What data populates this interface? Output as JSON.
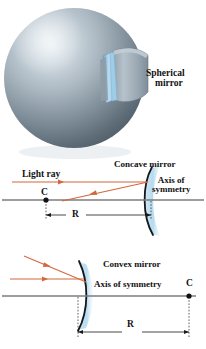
{
  "figure": {
    "title_labels": {
      "spherical_mirror_line1": "Spherical",
      "spherical_mirror_line2": "mirror",
      "concave_mirror": "Concave mirror",
      "axis_of_symmetry_line1": "Axis of",
      "axis_of_symmetry_line2": "symmetry",
      "light_ray": "Light ray",
      "center_point_concave": "C",
      "radius_concave": "R",
      "convex_mirror": "Convex mirror",
      "axis_of_symmetry_convex": "Axis of symmetry",
      "center_point_convex": "C",
      "radius_convex": "R"
    },
    "colors": {
      "ray": "#d4673c",
      "axis": "#7d7d7d",
      "mirror_glass": "#a9d4ec",
      "mirror_edge": "#1a1a1a",
      "sphere_light": "#cfd8de",
      "sphere_mid": "#98a6b0",
      "sphere_dark": "#5d6a74",
      "dimension": "#1a1a1a",
      "text": "#111111",
      "background": "#ffffff"
    },
    "panels": [
      {
        "name": "spherical-mirror-illustration",
        "description": "shaded sphere with a small curved mirror segment attached on the right"
      },
      {
        "name": "concave-mirror-diagram",
        "description": "horizontal light ray reflecting off a concave mirror toward center point C, radius R marked"
      },
      {
        "name": "convex-mirror-diagram",
        "description": "two parallel light rays striking a convex mirror, center point C on the right, radius R marked"
      }
    ]
  }
}
